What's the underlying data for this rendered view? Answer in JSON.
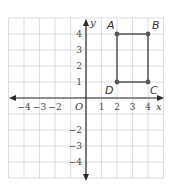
{
  "diagram": {
    "type": "coordinate-plane",
    "colors": {
      "background": "#ffffff",
      "grid": "#d4d4d4",
      "axis": "#2a2a2a",
      "shape": "#555555",
      "point": "#555555",
      "text": "#444444"
    },
    "grid": {
      "xmin": -5,
      "xmax": 5,
      "ymin": -5,
      "ymax": 5
    },
    "axes": {
      "x_label": "x",
      "y_label": "y",
      "origin_label": "O",
      "x_ticks": [
        {
          "value": -4,
          "label": "−4"
        },
        {
          "value": -3,
          "label": "−3"
        },
        {
          "value": -2,
          "label": "−2"
        },
        {
          "value": 1,
          "label": "1"
        },
        {
          "value": 2,
          "label": "2"
        },
        {
          "value": 3,
          "label": "3"
        },
        {
          "value": 4,
          "label": "4"
        }
      ],
      "y_ticks": [
        {
          "value": 4,
          "label": "4"
        },
        {
          "value": 3,
          "label": "3"
        },
        {
          "value": 2,
          "label": "2"
        },
        {
          "value": 1,
          "label": "1"
        },
        {
          "value": -2,
          "label": "−2"
        },
        {
          "value": -3,
          "label": "−3"
        },
        {
          "value": -4,
          "label": "−4"
        }
      ]
    },
    "shape": {
      "name": "rectangle ABCD",
      "vertices": [
        {
          "label": "A",
          "x": 2,
          "y": 4
        },
        {
          "label": "B",
          "x": 4,
          "y": 4
        },
        {
          "label": "C",
          "x": 4,
          "y": 1
        },
        {
          "label": "D",
          "x": 2,
          "y": 1
        }
      ]
    }
  }
}
